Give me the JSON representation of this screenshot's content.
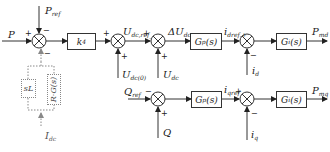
{
  "diagram": {
    "type": "control-block-diagram",
    "input_signal": {
      "base": "P",
      "sub": ""
    },
    "reference_power": {
      "base": "P",
      "sub": "ref"
    },
    "dc_current": {
      "base": "I",
      "sub": "dc"
    },
    "gain_block": {
      "base": "k",
      "sub": "4"
    },
    "feedback_blocks": {
      "inductive": "sL",
      "resistive": "R·G(s)"
    },
    "dc_voltage_ref": {
      "base": "U",
      "sub": "dc,ref_"
    },
    "dc_voltage_initial": {
      "base": "U",
      "sub": "dc(0)"
    },
    "dc_voltage": {
      "base": "U",
      "sub": "dc"
    },
    "delta_dc_voltage": {
      "base": "ΔU",
      "sub": "dc"
    },
    "voltage_controller": {
      "base": "G",
      "sub": "p",
      "suffix": "(s)"
    },
    "d_current_ref": {
      "base": "i",
      "sub": "dref.+"
    },
    "d_current": {
      "base": "i",
      "sub": "d"
    },
    "current_controller_d": {
      "base": "G",
      "sub": "i",
      "suffix": "(s)"
    },
    "output_d": {
      "base": "P",
      "sub": "md"
    },
    "reactive_ref": {
      "base": "Q",
      "sub": "ref"
    },
    "reactive": {
      "base": "Q",
      "sub": ""
    },
    "reactive_controller": {
      "base": "G",
      "sub": "p",
      "suffix": "(s)"
    },
    "q_current_ref": {
      "base": "i",
      "sub": "qref"
    },
    "q_current": {
      "base": "i",
      "sub": "q"
    },
    "current_controller_q": {
      "base": "G",
      "sub": "i",
      "suffix": "(s)"
    },
    "output_q": {
      "base": "P",
      "sub": "mq"
    },
    "signs": {
      "plus": "+",
      "minus": "−"
    }
  },
  "colors": {
    "line": "#333333",
    "dotted": "#888888",
    "text": "#222222"
  }
}
